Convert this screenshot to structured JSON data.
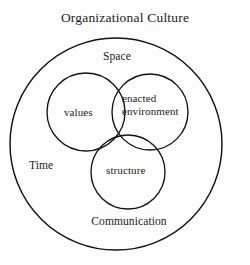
{
  "diagram": {
    "title": "Organizational Culture",
    "background_color": "#fdfdfd",
    "stroke_color": "#121212",
    "text_color": "#1c1c1c",
    "outer_boundary": {
      "name": "Organizational Culture",
      "label": "Organizational Culture",
      "cx": 116,
      "cy": 144,
      "r": 106
    },
    "context_labels": [
      {
        "id": "space",
        "label": "Space",
        "position": "top-inside"
      },
      {
        "id": "time",
        "label": "Time",
        "position": "left-inside"
      },
      {
        "id": "communication",
        "label": "Communication",
        "position": "bottom-inside"
      }
    ],
    "set_circles": [
      {
        "id": "values",
        "label": "values",
        "cx": 86,
        "cy": 112,
        "r": 39
      },
      {
        "id": "enacted-environment",
        "label": "enacted environment",
        "label_line1": "enacted",
        "label_line2": "environment",
        "cx": 150,
        "cy": 112,
        "r": 38
      },
      {
        "id": "structure",
        "label": "structure",
        "cx": 128,
        "cy": 172,
        "r": 37
      }
    ]
  }
}
